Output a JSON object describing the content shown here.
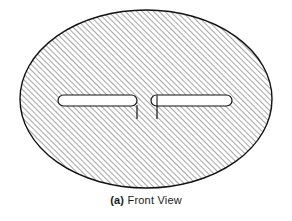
{
  "figure": {
    "title": "Front View",
    "caption_label": "(a)",
    "caption_text": "Front View",
    "caption_full": "(a) Front View",
    "view_type": "front-view",
    "drawing_style": "engineering-section-hatch",
    "colors": {
      "outline": "#111111",
      "hatch": "#3a3a3a",
      "fill": "#ffffff",
      "background": "#ffffff",
      "caption": "#1a1a1a"
    },
    "body": {
      "shape": "ellipse",
      "center_x": 146,
      "center_y": 99,
      "radius_x": 126,
      "radius_y": 89,
      "stroke_width": 1.4,
      "hatched": true
    },
    "hatch": {
      "angle_degrees": 45,
      "direction": "lower-left-to-upper-right",
      "spacing_px": 4,
      "stroke_width": 0.9
    },
    "slots": [
      {
        "name": "left-slot",
        "x": 58,
        "y": 95,
        "width": 79,
        "height": 11,
        "end_cap": "rounded",
        "tick": {
          "x": 137,
          "y_start": 106,
          "y_end": 119
        }
      },
      {
        "name": "right-slot",
        "x": 151,
        "y": 95,
        "width": 81,
        "height": 11,
        "end_cap": "rounded",
        "tick": {
          "x": 157,
          "y_start": 106,
          "y_end": 119
        }
      }
    ]
  }
}
